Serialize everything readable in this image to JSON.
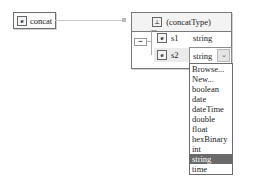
{
  "element": {
    "icon": "e",
    "name": "concat"
  },
  "complex_type": {
    "icon": "ct",
    "name": "(concatType)"
  },
  "sequence": {
    "icon": "sequence-icon",
    "glyph": "▪▪▪"
  },
  "children": [
    {
      "icon": "e",
      "name": "s1",
      "type": "string"
    },
    {
      "icon": "e",
      "name": "s2",
      "type": "string"
    }
  ],
  "combo": {
    "value": "string",
    "button_glyph": "⌄"
  },
  "dropdown": {
    "items": [
      "Browse...",
      "New...",
      "boolean",
      "date",
      "dateTime",
      "double",
      "float",
      "hexBinary",
      "int",
      "string",
      "time"
    ],
    "selected_index": 9
  },
  "colors": {
    "selected_bg": "#6a6a6a",
    "row_highlight": "#ebebeb",
    "border": "#7a7a7a"
  }
}
